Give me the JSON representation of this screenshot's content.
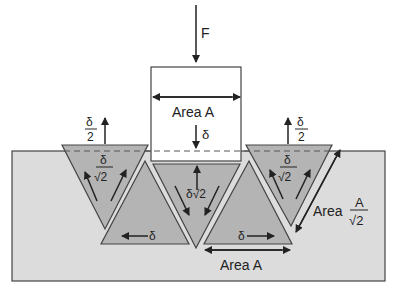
{
  "colors": {
    "background": "#ffffff",
    "substrate": "#dcdcdc",
    "wedge": "#b4b4b4",
    "stroke": "#444444",
    "punch": "#ffffff"
  },
  "labels": {
    "force": "F",
    "punch_area": "Area A",
    "punch_disp": "δ",
    "left_up_num": "δ",
    "left_up_den": "2",
    "right_up_num": "δ",
    "right_up_den": "2",
    "left_wedge_num": "δ",
    "left_wedge_den": "√2",
    "right_wedge_num": "δ",
    "right_wedge_den": "√2",
    "center_wedge": "δ√2",
    "left_slide": "δ",
    "right_slide": "δ",
    "bottom_area": "Area A",
    "side_area_word": "Area",
    "side_area_num": "A",
    "side_area_den": "√2"
  }
}
